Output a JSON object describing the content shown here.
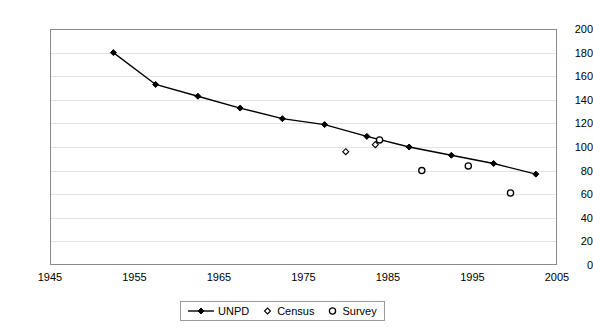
{
  "chart_data": {
    "type": "line",
    "title": "",
    "subtitle": "",
    "xlabel": "",
    "ylabel": "",
    "xlim": [
      1945,
      2005
    ],
    "ylim": [
      0,
      200
    ],
    "grid": true,
    "legend_position": "bottom",
    "x_ticks": [
      "1945",
      "1955",
      "1965",
      "1975",
      "1985",
      "1995",
      "2005"
    ],
    "x_tick_values": [
      1945,
      1955,
      1965,
      1975,
      1985,
      1995,
      2005
    ],
    "y_ticks": [
      "0",
      "20",
      "40",
      "60",
      "80",
      "100",
      "120",
      "140",
      "160",
      "180",
      "200"
    ],
    "y_tick_values": [
      0,
      20,
      40,
      60,
      80,
      100,
      120,
      140,
      160,
      180,
      200
    ],
    "series": [
      {
        "name": "UNPD",
        "marker": "filled-diamond",
        "line": true,
        "color": "#000000",
        "points": [
          {
            "x": 1952.5,
            "y": 180
          },
          {
            "x": 1957.5,
            "y": 153
          },
          {
            "x": 1962.5,
            "y": 143
          },
          {
            "x": 1967.5,
            "y": 133
          },
          {
            "x": 1972.5,
            "y": 124
          },
          {
            "x": 1977.5,
            "y": 119
          },
          {
            "x": 1982.5,
            "y": 109
          },
          {
            "x": 1987.5,
            "y": 100
          },
          {
            "x": 1992.5,
            "y": 93
          },
          {
            "x": 1997.5,
            "y": 86
          },
          {
            "x": 2002.5,
            "y": 77
          }
        ]
      },
      {
        "name": "Census",
        "marker": "open-diamond",
        "line": false,
        "color": "#000000",
        "points": [
          {
            "x": 1980.0,
            "y": 96
          },
          {
            "x": 1983.5,
            "y": 102
          }
        ]
      },
      {
        "name": "Survey",
        "marker": "open-circle",
        "line": false,
        "color": "#000000",
        "points": [
          {
            "x": 1984.0,
            "y": 106
          },
          {
            "x": 1989.0,
            "y": 80
          },
          {
            "x": 1994.5,
            "y": 84
          },
          {
            "x": 1999.5,
            "y": 61
          }
        ]
      }
    ]
  },
  "legend": {
    "items": [
      {
        "label": "UNPD",
        "marker": "line-filled-diamond"
      },
      {
        "label": "Census",
        "marker": "open-diamond"
      },
      {
        "label": "Survey",
        "marker": "open-circle"
      }
    ]
  }
}
